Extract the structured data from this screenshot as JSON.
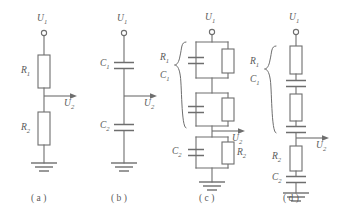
{
  "figure": {
    "background_color": "#ffffff",
    "line_color": "#6e6e6e",
    "text_color": "#5a5a5a"
  },
  "circuits": [
    {
      "id": "a",
      "caption": "( a )",
      "input_label": "U",
      "input_sub": "1",
      "output_label": "U",
      "output_sub": "2",
      "components": [
        {
          "name": "R",
          "sub": "1",
          "type": "resistor",
          "position": "upper-series"
        },
        {
          "name": "R",
          "sub": "2",
          "type": "resistor",
          "position": "lower-series"
        }
      ],
      "description": "Resistive divider: R1 in series with R2, output taken at the junction."
    },
    {
      "id": "b",
      "caption": "( b )",
      "input_label": "U",
      "input_sub": "1",
      "output_label": "U",
      "output_sub": "2",
      "components": [
        {
          "name": "C",
          "sub": "1",
          "type": "capacitor",
          "position": "upper-series"
        },
        {
          "name": "C",
          "sub": "2",
          "type": "capacitor",
          "position": "lower-series"
        }
      ],
      "description": "Capacitive divider: C1 in series with C2, output taken at the junction."
    },
    {
      "id": "c",
      "caption": "( c )",
      "input_label": "U",
      "input_sub": "1",
      "output_label": "U",
      "output_sub": "2",
      "brace_labels": [
        {
          "name": "R",
          "sub": "1"
        },
        {
          "name": "C",
          "sub": "1"
        }
      ],
      "components": [
        {
          "name": "R",
          "sub": "1",
          "type": "resistor",
          "position": "upper-block-1-parallel"
        },
        {
          "name": "C",
          "sub": "1",
          "type": "capacitor",
          "position": "upper-block-1-parallel"
        },
        {
          "name": "R",
          "sub": "1",
          "type": "resistor",
          "position": "upper-block-2-parallel"
        },
        {
          "name": "C",
          "sub": "1",
          "type": "capacitor",
          "position": "upper-block-2-parallel"
        },
        {
          "name": "C",
          "sub": "2",
          "type": "capacitor",
          "position": "lower-block-parallel-left"
        },
        {
          "name": "R",
          "sub": "2",
          "type": "resistor",
          "position": "lower-block-parallel-right"
        }
      ],
      "description": "Two stacked parallel RC sections (braced as R1/C1) above a parallel C2 || R2 section."
    },
    {
      "id": "d",
      "caption": "( d )",
      "input_label": "U",
      "input_sub": "1",
      "output_label": "U",
      "output_sub": "2",
      "brace_labels": [
        {
          "name": "R",
          "sub": "1"
        },
        {
          "name": "C",
          "sub": "1"
        }
      ],
      "components": [
        {
          "name": "R",
          "sub": "1",
          "type": "resistor",
          "position": "upper-series-1"
        },
        {
          "name": "C",
          "sub": "1",
          "type": "capacitor",
          "position": "upper-series-1"
        },
        {
          "name": "R",
          "sub": "1",
          "type": "resistor",
          "position": "upper-series-2"
        },
        {
          "name": "C",
          "sub": "1",
          "type": "capacitor",
          "position": "upper-series-2"
        },
        {
          "name": "R",
          "sub": "2",
          "type": "resistor",
          "position": "lower-series"
        },
        {
          "name": "C",
          "sub": "2",
          "type": "capacitor",
          "position": "lower-series"
        }
      ],
      "description": "Two stacked series RC sections (braced as R1/C1) above a series R2 then C2 to ground."
    }
  ],
  "labels": {
    "a_U1": "U",
    "a_U1_sub": "1",
    "a_R1": "R",
    "a_R1_sub": "1",
    "a_R2": "R",
    "a_R2_sub": "2",
    "a_U2": "U",
    "a_U2_sub": "2",
    "a_caption": "( a )",
    "b_U1": "U",
    "b_U1_sub": "1",
    "b_C1": "C",
    "b_C1_sub": "1",
    "b_C2": "C",
    "b_C2_sub": "2",
    "b_U2": "U",
    "b_U2_sub": "2",
    "b_caption": "( b )",
    "c_U1": "U",
    "c_U1_sub": "1",
    "c_R1": "R",
    "c_R1_sub": "1",
    "c_C1": "C",
    "c_C1_sub": "1",
    "c_C2": "C",
    "c_C2_sub": "2",
    "c_R2": "R",
    "c_R2_sub": "2",
    "c_U2": "U",
    "c_U2_sub": "2",
    "c_caption": "( c )",
    "d_U1": "U",
    "d_U1_sub": "1",
    "d_R1": "R",
    "d_R1_sub": "1",
    "d_C1": "C",
    "d_C1_sub": "1",
    "d_R2": "R",
    "d_R2_sub": "2",
    "d_C2": "C",
    "d_C2_sub": "2",
    "d_U2": "U",
    "d_U2_sub": "2",
    "d_caption": "( d )"
  }
}
